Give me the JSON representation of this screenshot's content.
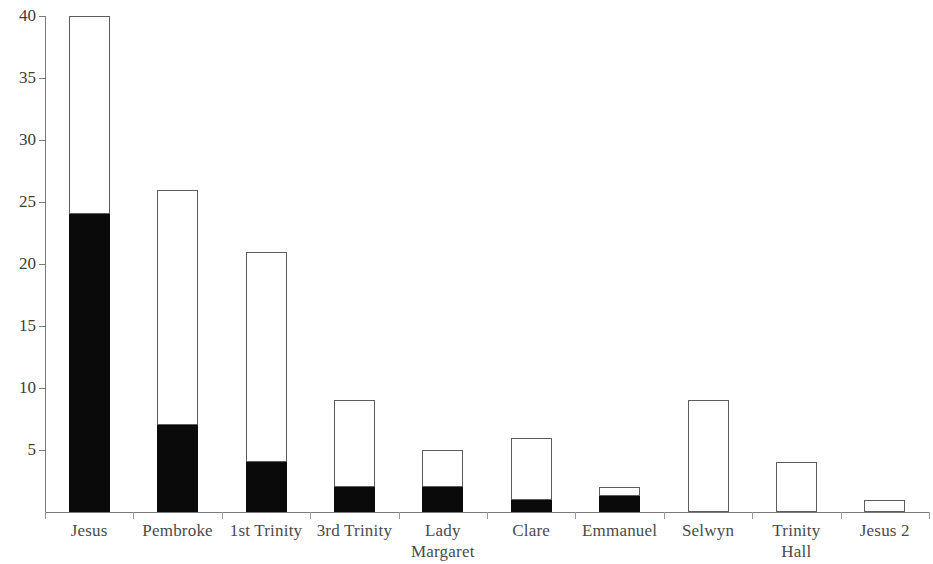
{
  "chart_data": {
    "type": "bar",
    "subtype": "stacked-bar",
    "title": "",
    "subtitle": "",
    "xlabel": "",
    "ylabel": "",
    "categories": [
      "Jesus",
      "Pembroke",
      "1st Trinity",
      "3rd Trinity",
      "Lady Margaret",
      "Clare",
      "Emmanuel",
      "Selwyn",
      "Trinity Hall",
      "Jesus 2"
    ],
    "category_label_lines": [
      [
        "Jesus"
      ],
      [
        "Pembroke"
      ],
      [
        "1st Trinity"
      ],
      [
        "3rd Trinity"
      ],
      [
        "Lady",
        "Margaret"
      ],
      [
        "Clare"
      ],
      [
        "Emmanuel"
      ],
      [
        "Selwyn"
      ],
      [
        "Trinity",
        "Hall"
      ],
      [
        "Jesus 2"
      ]
    ],
    "series": [
      {
        "name": "black",
        "color": "#0a0a0a",
        "values": [
          24,
          7,
          4,
          2,
          2,
          1,
          1.3,
          0,
          0,
          0
        ]
      },
      {
        "name": "white",
        "color": "#ffffff",
        "values": [
          16,
          19,
          17,
          7,
          3,
          5,
          0.7,
          9,
          4,
          1
        ]
      }
    ],
    "totals": [
      40,
      26,
      21,
      9,
      5,
      6,
      2,
      9,
      4,
      1
    ],
    "ylim": [
      0,
      40
    ],
    "yticks": [
      5,
      10,
      15,
      20,
      25,
      30,
      35,
      40
    ],
    "ytick_labels": [
      "5",
      "10",
      "15",
      "20",
      "25",
      "30",
      "35",
      "40"
    ],
    "grid": false,
    "legend": null,
    "annotations": []
  },
  "axis": {
    "y_axis_color": "#7a7a7a",
    "x_axis_color": "#7a7a7a",
    "tick_color": "#9a9a9a"
  },
  "style": {
    "bar_outline_color": "#5d5d5d",
    "fill_black": "#0a0a0a",
    "fill_white": "#ffffff",
    "background": "#ffffff",
    "text_color": "#3c3c3c"
  }
}
